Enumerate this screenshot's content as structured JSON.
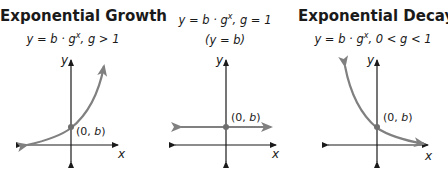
{
  "colors": {
    "axis": "#1a1a1a",
    "curve": "#808080",
    "point": "#6e6e6e",
    "text": "#1a1a1a"
  },
  "panels": [
    {
      "title": "Exponential Growth",
      "formula_lhs": "y = b · g",
      "formula_exp": "x",
      "formula_condition": ", g > 1",
      "formula_note": "",
      "axis_x_label": "x",
      "axis_y_label": "y",
      "point_label": "(0, b)"
    },
    {
      "title": "",
      "formula_lhs": "y = b · g",
      "formula_exp": "x",
      "formula_condition": ", g = 1",
      "formula_note": "(y = b)",
      "axis_x_label": "x",
      "axis_y_label": "y",
      "point_label": "(0, b)"
    },
    {
      "title": "Exponential Decay",
      "formula_lhs": "y = b · g",
      "formula_exp": "x",
      "formula_condition": ", 0 < g < 1",
      "formula_note": "",
      "axis_x_label": "x",
      "axis_y_label": "y",
      "point_label": "(0, b)"
    }
  ]
}
